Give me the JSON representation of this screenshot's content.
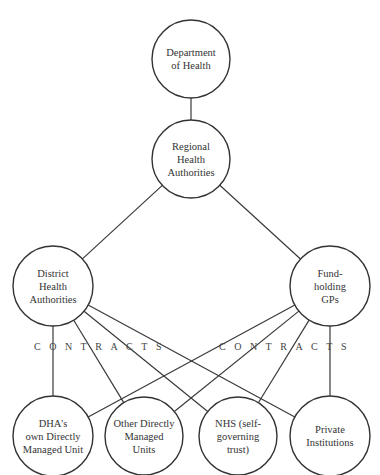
{
  "diagram": {
    "nodes": [
      {
        "id": "dept",
        "label": "Department\nof Health",
        "cx": 191,
        "cy": 59,
        "r": 39
      },
      {
        "id": "rha",
        "label": "Regional\nHealth\nAuthorities",
        "cx": 191,
        "cy": 159,
        "r": 39
      },
      {
        "id": "dha",
        "label": "District\nHealth\nAuthorities",
        "cx": 53,
        "cy": 286,
        "r": 40
      },
      {
        "id": "gps",
        "label": "Fund-\nholding\nGPs",
        "cx": 330,
        "cy": 286,
        "r": 40
      },
      {
        "id": "dha_unit",
        "label": "DHA's\nown Directly\nManaged Unit",
        "cx": 53,
        "cy": 436,
        "r": 40
      },
      {
        "id": "other_units",
        "label": "Other Directly\nManaged\nUnits",
        "cx": 144,
        "cy": 436,
        "r": 39
      },
      {
        "id": "nhs_trust",
        "label": "NHS (self-\ngoverning\ntrust)",
        "cx": 238,
        "cy": 436,
        "r": 39
      },
      {
        "id": "private",
        "label": "Private\nInstitutions",
        "cx": 330,
        "cy": 436,
        "r": 40
      }
    ],
    "edges": [
      [
        "dept",
        "rha"
      ],
      [
        "rha",
        "dha"
      ],
      [
        "rha",
        "gps"
      ],
      [
        "dha",
        "dha_unit"
      ],
      [
        "dha",
        "other_units"
      ],
      [
        "dha",
        "nhs_trust"
      ],
      [
        "dha",
        "private"
      ],
      [
        "gps",
        "dha_unit"
      ],
      [
        "gps",
        "other_units"
      ],
      [
        "gps",
        "nhs_trust"
      ],
      [
        "gps",
        "private"
      ]
    ],
    "annotations": [
      {
        "text": "CONTRACTS",
        "x": 34,
        "y": 348
      },
      {
        "text": "CONTRACTS",
        "x": 219,
        "y": 348
      }
    ]
  }
}
